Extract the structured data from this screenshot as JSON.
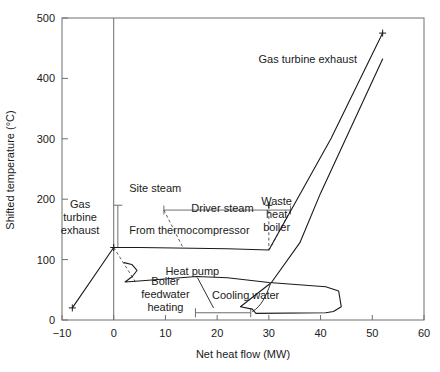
{
  "chart_data": {
    "type": "line",
    "title": "",
    "xlabel": "Net heat flow (MW)",
    "ylabel": "Shifted temperature (°C)",
    "xlim": [
      -10,
      60
    ],
    "ylim": [
      0,
      500
    ],
    "xticks": [
      "−10",
      "0",
      "10",
      "20",
      "30",
      "40",
      "50",
      "60"
    ],
    "xtick_values": [
      -10,
      0,
      10,
      20,
      30,
      40,
      50,
      60
    ],
    "yticks": [
      "0",
      "100",
      "200",
      "300",
      "400",
      "500"
    ],
    "ytick_values": [
      0,
      100,
      200,
      300,
      400,
      500
    ],
    "grid": false,
    "legend": "none",
    "series": [
      {
        "name": "Hot composite curve",
        "marker": "plus at both ends",
        "points": [
          [
            -8,
            20
          ],
          [
            0,
            120
          ],
          [
            5,
            120
          ],
          [
            22,
            118
          ],
          [
            30,
            116
          ],
          [
            42,
            300
          ],
          [
            52,
            475
          ]
        ]
      },
      {
        "name": "Cold composite curve",
        "points": [
          [
            2,
            95
          ],
          [
            3.5,
            92
          ],
          [
            4.5,
            82
          ],
          [
            3.6,
            72
          ],
          [
            2.2,
            63
          ],
          [
            5.5,
            65
          ],
          [
            16,
            72
          ],
          [
            22,
            70
          ],
          [
            30,
            62
          ],
          [
            41,
            55
          ],
          [
            43.5,
            48
          ],
          [
            44,
            22
          ],
          [
            42.5,
            14
          ],
          [
            41,
            12
          ],
          [
            27.5,
            11
          ],
          [
            26.8,
            18
          ],
          [
            24.5,
            22
          ],
          [
            30.5,
            62
          ],
          [
            36,
            128
          ],
          [
            40,
            210
          ],
          [
            52,
            432
          ]
        ]
      }
    ],
    "annotations": [
      {
        "name": "gas-turbine-exhaust-left",
        "text": "Gas\nturbine\nexhaust",
        "x": -6.5,
        "y": 185
      },
      {
        "name": "gas-turbine-exhaust-right",
        "text": "Gas turbine exhaust",
        "x": 28,
        "y": 425
      },
      {
        "name": "site-steam",
        "text": "Site steam",
        "x": 3,
        "y": 212
      },
      {
        "name": "driver-steam",
        "text": "Driver steam",
        "x": 15,
        "y": 178
      },
      {
        "name": "from-thermocompressor",
        "text": "From thermocompressor",
        "x": 3,
        "y": 142
      },
      {
        "name": "waste-heat-boiler",
        "text": "Waste\nheat\nboiler",
        "x": 31.5,
        "y": 190
      },
      {
        "name": "heat-pump",
        "text": "Heat pump",
        "x": 10,
        "y": 75
      },
      {
        "name": "boiler-feedwater-heating",
        "text": "Boiler\nfeedwater\nheating",
        "x": 10,
        "y": 58
      },
      {
        "name": "cooling-water",
        "text": "Cooling water",
        "x": 19,
        "y": 35
      }
    ],
    "measure_bars": [
      {
        "name": "site-steam-bar",
        "orientation": "vertical",
        "x": 0.8,
        "y_from": 120,
        "y_to": 190
      },
      {
        "name": "driver-steam-bar",
        "orientation": "horizontal",
        "y": 182,
        "x_from": 9.7,
        "x_to": 34.2
      },
      {
        "name": "cooling-water-bar",
        "orientation": "horizontal",
        "y": 12,
        "x_from": 15.8,
        "x_to": 26.5
      }
    ]
  },
  "labels": {
    "ylabel": "Shifted temperature (°C)",
    "xlabel": "Net heat flow (MW)"
  }
}
